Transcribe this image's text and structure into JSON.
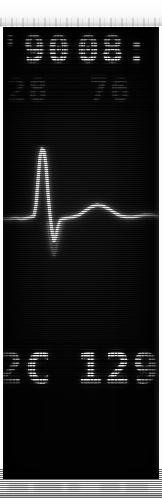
{
  "device": {
    "kind": "patient-monitor-crt",
    "screen_background": "#040404",
    "glyph_color": "#f2f2f2",
    "dim_glyph_color": "#3b3b3b",
    "page_margin_color": "#ffffff"
  },
  "display": {
    "top_row": {
      "left_value": "'90",
      "right_value": "08:"
    },
    "second_row": {
      "left_value": "28",
      "right_value": "76"
    },
    "bottom_row": {
      "left_value": "2C",
      "right_value": "129"
    }
  },
  "waveform": {
    "label": "ecg-trace",
    "type": "ecg",
    "baseline_y": 72,
    "points": "0,74 6,74 12,73 18,74 24,73 28,72 31,71 33,60 35,36 37,12 39,4 41,6 43,20 45,48 47,70 49,86 51,96 53,92 55,82 57,76 59,74 64,73 70,72 76,70 82,66 88,62 94,60 100,61 106,64 112,68 118,71 124,72 130,72 136,71 142,70 148,70 156,71",
    "s_tail": "45,78 47,92 49,104 51,110 53,104 55,92 57,82 59,76"
  },
  "bottom_strip": {
    "label": "blurred-lower-edge",
    "blobs": [
      {
        "left": 8,
        "width": 20
      },
      {
        "left": 34,
        "width": 28
      },
      {
        "left": 68,
        "width": 12
      },
      {
        "left": 100,
        "width": 20
      },
      {
        "left": 126,
        "width": 22
      }
    ]
  }
}
